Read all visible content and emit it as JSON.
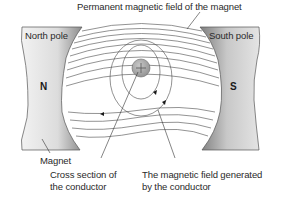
{
  "diagram": {
    "title_label": "Permanent magnetic field of the magnet",
    "north_pole_label": "North pole",
    "south_pole_label": "South pole",
    "north_letter": "N",
    "south_letter": "S",
    "magnet_label": "Magnet",
    "conductor_label_line1": "Cross section of",
    "conductor_label_line2": "the conductor",
    "field_label_line1": "The magnetic field generated",
    "field_label_line2": "by the conductor",
    "conductor_symbol": "+"
  },
  "colors": {
    "magnet_light": "#e6e6e6",
    "magnet_dark": "#8a8a8a",
    "line": "#4a4a4a",
    "conductor_fill": "#a8a8a8",
    "text": "#2a2a2a"
  }
}
